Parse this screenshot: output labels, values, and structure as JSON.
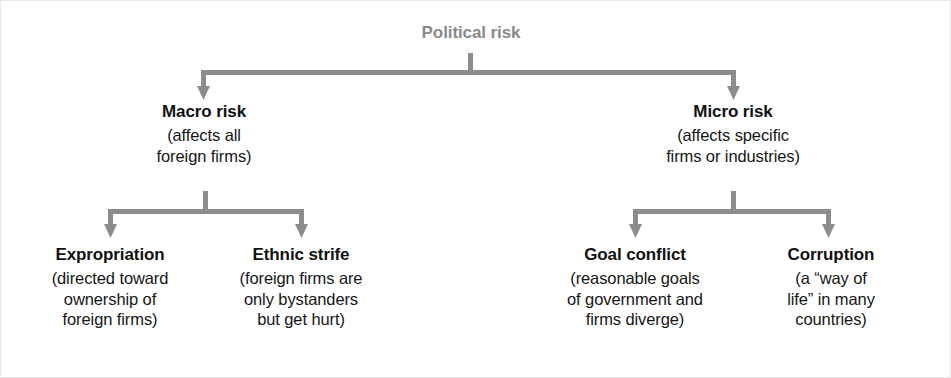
{
  "diagram": {
    "type": "hierarchy-tree",
    "title": "Political risk",
    "root": {
      "id": "political-risk",
      "label": "Political risk",
      "color": "#8a8a8a"
    },
    "connector_color": "#8c8c8c",
    "level1": [
      {
        "id": "macro-risk",
        "label": "Macro risk",
        "description_lines": [
          "(affects all",
          "foreign firms)"
        ]
      },
      {
        "id": "micro-risk",
        "label": "Micro risk",
        "description_lines": [
          "(affects specific",
          "firms or industries)"
        ]
      }
    ],
    "level2": [
      {
        "id": "expropriation",
        "parent": "macro-risk",
        "label": "Expropriation",
        "description_lines": [
          "(directed toward",
          "ownership of",
          "foreign firms)"
        ]
      },
      {
        "id": "ethnic-strife",
        "parent": "macro-risk",
        "label": "Ethnic strife",
        "description_lines": [
          "(foreign firms are",
          "only bystanders",
          "but get hurt)"
        ]
      },
      {
        "id": "goal-conflict",
        "parent": "micro-risk",
        "label": "Goal conflict",
        "description_lines": [
          "(reasonable goals",
          "of government and",
          "firms diverge)"
        ]
      },
      {
        "id": "corruption",
        "parent": "micro-risk",
        "label": "Corruption",
        "description_lines": [
          "(a “way of",
          "life” in many",
          "countries)"
        ]
      }
    ]
  }
}
